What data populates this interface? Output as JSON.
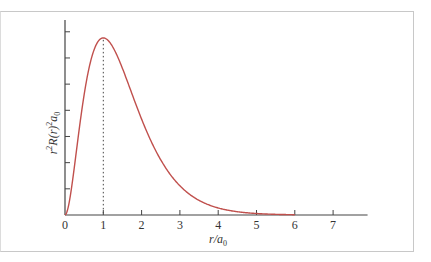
{
  "chart_data": {
    "type": "line",
    "title": "",
    "xlabel": "r/a0",
    "ylabel": "r^2 R(r)^2 a0",
    "xlim": [
      0,
      7.9
    ],
    "ylim": [
      0,
      0.58
    ],
    "x_ticks": [
      0,
      1,
      2,
      3,
      4,
      5,
      6,
      7
    ],
    "x_tick_labels": [
      "0",
      "1",
      "2",
      "3",
      "4",
      "5",
      "6",
      "7"
    ],
    "y_ticks": [
      0.08,
      0.16,
      0.24,
      0.32,
      0.4,
      0.48,
      0.56
    ],
    "y_tick_labels": [],
    "grid": false,
    "legend": null,
    "series": [
      {
        "name": "radial distribution 1s",
        "color": "#c0504d",
        "x": [
          0,
          0.25,
          0.5,
          0.75,
          1.0,
          1.25,
          1.5,
          1.75,
          2.0,
          2.5,
          3.0,
          3.5,
          4.0,
          4.5,
          5.0,
          5.5,
          6.0
        ],
        "y": [
          0,
          0.152,
          0.368,
          0.502,
          0.541,
          0.513,
          0.448,
          0.371,
          0.293,
          0.168,
          0.089,
          0.045,
          0.021,
          0.01,
          0.005,
          0.002,
          0.001
        ]
      }
    ],
    "annotations": [
      {
        "type": "vertical-dotted-line",
        "x": 1.0,
        "label": "maximum at r = a0"
      }
    ]
  },
  "labels": {
    "xlabel_main": "r/a",
    "xlabel_sub": "0",
    "ylabel_pre": "r",
    "ylabel_sup1": "2",
    "ylabel_mid": "R(r)",
    "ylabel_sup2": "2",
    "ylabel_a": "a",
    "ylabel_sub": "0"
  }
}
